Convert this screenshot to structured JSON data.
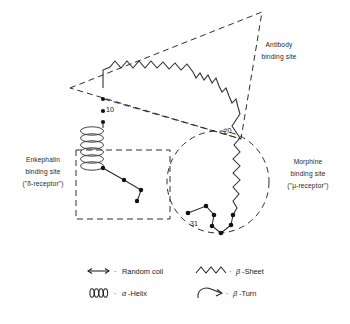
{
  "figure": {
    "background_color": "#ffffff",
    "ink_color": "#1f1f1f"
  },
  "annotations": {
    "antibody": {
      "line1": "Antibody",
      "line2": "binding site"
    },
    "enkephalin": {
      "line1": "Enkephalin",
      "line2": "binding site",
      "line3": "(\"δ-receptor\")"
    },
    "morphine": {
      "line1": "Morphine",
      "line2": "binding site",
      "line3": "(\"μ-receptor\")"
    }
  },
  "residue_numbers": [
    {
      "id": "res-10",
      "label": "10"
    },
    {
      "id": "res-20",
      "label": "20"
    },
    {
      "id": "res-31",
      "label": "31"
    }
  ],
  "legend": {
    "items": [
      {
        "id": "random-coil",
        "symbol": "double-arrow-line",
        "separator": "·",
        "label": "Random coil"
      },
      {
        "id": "beta-sheet",
        "symbol": "zigzag",
        "separator": "·",
        "greek": "β",
        "label": "-Sheet"
      },
      {
        "id": "alpha-helix",
        "symbol": "helix-coil",
        "separator": "·",
        "greek": "α",
        "label": "-Helix"
      },
      {
        "id": "beta-turn",
        "symbol": "hook-arrow",
        "separator": "·",
        "greek": "β",
        "label": "-Turn"
      }
    ]
  },
  "regions": {
    "antibody_site": {
      "shape": "dashed-triangle"
    },
    "enkephalin_site": {
      "shape": "dashed-rectangle"
    },
    "morphine_site": {
      "shape": "dashed-circle"
    }
  }
}
